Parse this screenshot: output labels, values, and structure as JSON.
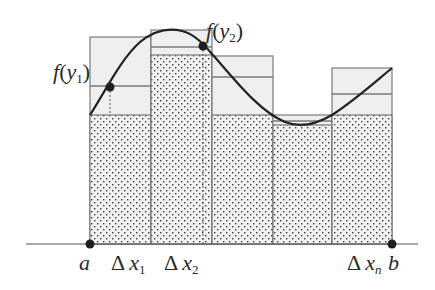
{
  "diagram": {
    "colors": {
      "background": "#ffffff",
      "rect_fill_light": "#efefef",
      "rect_stroke": "#7a7a7a",
      "dot_pattern": "#3a3a3a",
      "curve": "#222222",
      "axis": "#555555"
    },
    "axis": {
      "x_start": 26,
      "x_end": 418,
      "y": 244
    },
    "partition_x": [
      90,
      151,
      212,
      273,
      332,
      392
    ],
    "rects": [
      {
        "upper_top": 37,
        "sample_line": 86,
        "lower_top": 115
      },
      {
        "upper_top": 30,
        "sample_line": 47,
        "lower_top": 55
      },
      {
        "upper_top": 56,
        "sample_line": 77,
        "lower_top": 115
      },
      {
        "upper_top": 115,
        "sample_line": 121,
        "lower_top": 125
      },
      {
        "upper_top": 68,
        "sample_line": 94,
        "lower_top": 115
      }
    ],
    "curve_path": "M90,115 C105,92 120,60 140,42 C155,30 170,28 182,31 C195,34 205,46 213,55 C235,80 260,112 285,122 C300,128 315,125 332,115 C355,100 375,82 392,68",
    "sample_points": [
      {
        "x": 110,
        "y": 87,
        "label": "f(y1)",
        "vline_to": 115
      },
      {
        "x": 203,
        "y": 46,
        "label": "f(y2)",
        "vline_to": 244
      }
    ],
    "endpoints": [
      {
        "x": 90,
        "y": 244,
        "label": "a"
      },
      {
        "x": 392,
        "y": 244,
        "label": "b"
      }
    ],
    "labels": {
      "f_y1": {
        "f": "f",
        "open": "(",
        "var": "y",
        "sub": "1",
        "close": ")"
      },
      "f_y2": {
        "f": "f",
        "open": "(",
        "var": "y",
        "sub": "2",
        "close": ")"
      },
      "a": "a",
      "b": "b",
      "dx1": {
        "delta": "Δ",
        "var": "x",
        "sub": "1"
      },
      "dx2": {
        "delta": "Δ",
        "var": "x",
        "sub": "2"
      },
      "dxn": {
        "delta": "Δ",
        "var": "x",
        "sub": "n"
      }
    }
  }
}
